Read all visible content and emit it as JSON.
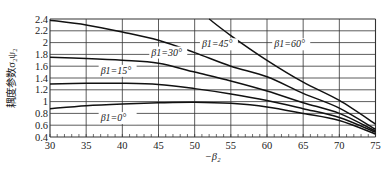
{
  "chart_data": {
    "type": "line",
    "title": "",
    "xlabel": "−β₂",
    "ylabel": "耦度参数σ₂ψ₂",
    "xlim": [
      30,
      75
    ],
    "ylim": [
      0.4,
      2.4
    ],
    "grid": true,
    "x_ticks": [
      30,
      35,
      40,
      45,
      50,
      55,
      60,
      65,
      70,
      75
    ],
    "y_ticks": [
      0.4,
      0.6,
      0.8,
      1.0,
      1.2,
      1.4,
      1.6,
      1.8,
      2.0,
      2.2,
      2.4
    ],
    "x_tick_labels": [
      "30",
      "35",
      "40",
      "45",
      "50",
      "55",
      "60",
      "65",
      "70",
      "75"
    ],
    "y_tick_labels": [
      "0.4",
      "0.6",
      "0.8",
      "1",
      "1.2",
      "1.4",
      "1.6",
      "1.8",
      "2",
      "2.2",
      "2.4"
    ],
    "series": [
      {
        "name": "β1=0°",
        "label_at": [
          37,
          0.67
        ],
        "x": [
          30,
          35,
          40,
          45,
          50,
          55,
          60,
          65,
          70,
          75
        ],
        "y": [
          0.88,
          0.93,
          0.96,
          0.98,
          0.99,
          0.97,
          0.91,
          0.8,
          0.68,
          0.45
        ]
      },
      {
        "name": "β1=15°",
        "label_at": [
          37,
          1.47
        ],
        "x": [
          30,
          35,
          40,
          45,
          50,
          55,
          60,
          65,
          70,
          75
        ],
        "y": [
          1.3,
          1.31,
          1.31,
          1.29,
          1.22,
          1.13,
          1.02,
          0.88,
          0.73,
          0.48
        ]
      },
      {
        "name": "β1=30°",
        "label_at": [
          44,
          1.78
        ],
        "x": [
          30,
          35,
          40,
          45,
          50,
          55,
          60,
          65,
          70,
          75
        ],
        "y": [
          1.75,
          1.73,
          1.7,
          1.65,
          1.5,
          1.35,
          1.18,
          0.98,
          0.8,
          0.5
        ]
      },
      {
        "name": "β1=45°",
        "label_at": [
          51,
          1.92
        ],
        "x": [
          30,
          35,
          40,
          45,
          50,
          55,
          60,
          65,
          70,
          75
        ],
        "y": [
          2.38,
          2.3,
          2.18,
          2.04,
          1.83,
          1.6,
          1.42,
          1.14,
          0.89,
          0.53
        ]
      },
      {
        "name": "β1=60°",
        "label_at": [
          61,
          1.92
        ],
        "x": [
          52,
          55,
          60,
          65,
          70,
          75
        ],
        "y": [
          2.4,
          2.12,
          1.7,
          1.33,
          1.02,
          0.62
        ]
      }
    ]
  }
}
